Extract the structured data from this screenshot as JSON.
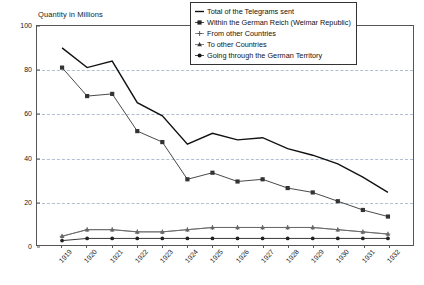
{
  "chart_data": {
    "type": "line",
    "title": "Quantity in Millions",
    "ylabel": "Quantity in Millions",
    "xlabel": "",
    "ylim": [
      0,
      100
    ],
    "yticks": [
      0,
      20,
      40,
      60,
      80,
      100
    ],
    "grid": true,
    "legend_position": "top-right",
    "categories": [
      "1919",
      "1920",
      "1921",
      "1922",
      "1923",
      "1924",
      "1925",
      "1926",
      "1927",
      "1928",
      "1929",
      "1930",
      "1931",
      "1932"
    ],
    "series": [
      {
        "name": "Total of the Telegrams sent",
        "marker": "line-dash",
        "values": [
          90,
          81,
          84,
          65,
          59,
          46,
          51,
          48,
          49,
          44,
          41,
          37,
          31,
          24
        ]
      },
      {
        "name": "Within the German Reich (Weimar Republic)",
        "marker": "square",
        "values": [
          81,
          68,
          69,
          52,
          47,
          30,
          33,
          29,
          30,
          26,
          24,
          20,
          16,
          13
        ]
      },
      {
        "name": "From other Countries",
        "marker": "plus",
        "values": [
          4,
          7,
          7,
          6,
          6,
          7,
          8,
          8,
          8,
          8,
          8,
          7,
          6,
          5
        ]
      },
      {
        "name": "To other Countries",
        "marker": "triangle",
        "values": [
          4,
          7,
          7,
          6,
          6,
          7,
          8,
          8,
          8,
          8,
          8,
          7,
          6,
          5
        ]
      },
      {
        "name": "Going through the German Territory",
        "marker": "diamond",
        "values": [
          2,
          3,
          3,
          3,
          3,
          3,
          3,
          3,
          3,
          3,
          3,
          3,
          3,
          3
        ]
      }
    ],
    "colors": {
      "axis": "#555555",
      "grid": "#9aa7c4",
      "total": "#111111",
      "within_reich": "#333333",
      "from_other": "#777777",
      "to_other": "#666666",
      "through": "#222222"
    }
  },
  "legend": {
    "entries": [
      {
        "label": "Total of the Telegrams sent",
        "icon": "dash-line-icon"
      },
      {
        "label": "Within the German Reich (Weimar Republic)",
        "icon": "square-marker-icon"
      },
      {
        "label": "From other Countries",
        "icon": "plus-marker-icon"
      },
      {
        "label": "To other Countries",
        "icon": "triangle-marker-icon"
      },
      {
        "label": "Going through the German Territory",
        "icon": "diamond-marker-icon"
      }
    ]
  }
}
